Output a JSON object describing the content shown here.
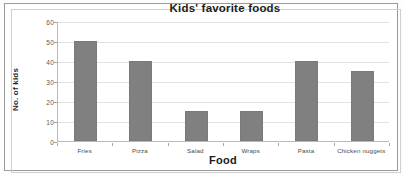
{
  "chart_data": {
    "type": "bar",
    "title": "Kids' favorite foods",
    "xlabel": "Food",
    "ylabel": "No. of kids",
    "categories": [
      "Fries",
      "Pizza",
      "Salad",
      "Wraps",
      "Pasta",
      "Chicken nuggets"
    ],
    "values": [
      50,
      40,
      15,
      15,
      40,
      35
    ],
    "ylim": [
      0,
      60
    ],
    "yticks": [
      0,
      10,
      20,
      30,
      40,
      50,
      60
    ],
    "ytick_labels": [
      "0",
      "10",
      "20",
      "30",
      "40",
      "50",
      "60"
    ],
    "grid": true,
    "legend": false,
    "bar_color": "#808080",
    "gridline_color": "#e2e2e2",
    "axis_color": "#b9b9b9",
    "plot_background": "#ffffff",
    "figure_background": "#ffffff",
    "border_color": "#9a9a9a"
  }
}
